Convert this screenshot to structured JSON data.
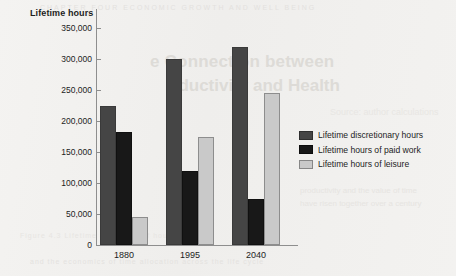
{
  "chart_data": {
    "type": "bar",
    "title": "Lifetime hours",
    "xlabel": "",
    "ylabel": "Lifetime hours",
    "categories": [
      "1880",
      "1995",
      "2040"
    ],
    "series": [
      {
        "name": "Lifetime discretionary hours",
        "color": "#454545",
        "values": [
          225000,
          300000,
          320000
        ]
      },
      {
        "name": "Lifetime hours of paid work",
        "color": "#181818",
        "values": [
          183000,
          120000,
          75000
        ]
      },
      {
        "name": "Lifetime hours of leisure",
        "color": "#c9c9c9",
        "values": [
          45000,
          175000,
          245000
        ]
      }
    ],
    "ylim": [
      0,
      350000
    ],
    "ytick_values": [
      0,
      50000,
      100000,
      150000,
      200000,
      250000,
      300000,
      350000
    ],
    "ytick_labels": [
      "0",
      "50,000",
      "100,000",
      "150,000",
      "200,000",
      "250,000",
      "300,000",
      "350,000"
    ],
    "grid": false,
    "legend_position": "right"
  },
  "legend": {
    "items": [
      {
        "label": "Lifetime discretionary hours"
      },
      {
        "label": "Lifetime hours of paid work"
      },
      {
        "label": "Lifetime hours of leisure"
      }
    ]
  },
  "background_text": {
    "heading_line1": "e Connection between",
    "heading_line2": "oductivity and Health",
    "top_strip": "CHAPTER  FOUR   ECONOMIC GROWTH AND WELL BEING",
    "right_line1": "productivity and the value of time",
    "right_line2": "have risen together over a century",
    "mid_right": "Source: author calculations",
    "bottom_strip": "and the economics of time allocation across the life cycle",
    "lower_left": "Figure 4.3   Lifetime allocation of hours"
  }
}
